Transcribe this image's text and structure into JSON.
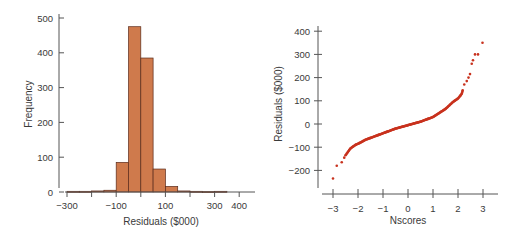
{
  "colors": {
    "bar_fill": "#cf7a4c",
    "bar_stroke": "#5a2a1a",
    "point": "#c8321e",
    "axis": "#555555",
    "text": "#3a3a3a"
  },
  "chart_data": [
    {
      "type": "bar",
      "subtype": "histogram",
      "title": "",
      "xlabel": "Residuals ($000)",
      "ylabel": "Frequency",
      "xlim": [
        -300,
        450
      ],
      "ylim": [
        0,
        500
      ],
      "x_ticks": [
        -300,
        -200,
        -100,
        0,
        100,
        200,
        300,
        400
      ],
      "x_tick_labels": [
        "-300",
        "",
        "-100",
        "",
        "100",
        "",
        "300",
        "400"
      ],
      "y_ticks": [
        0,
        100,
        200,
        300,
        400,
        500
      ],
      "y_tick_labels": [
        "0",
        "100",
        "200",
        "300",
        "400",
        "500"
      ],
      "grid": false,
      "bin_width": 50,
      "bins": [
        {
          "start": -300,
          "end": -250,
          "count": 2
        },
        {
          "start": -250,
          "end": -200,
          "count": 2
        },
        {
          "start": -200,
          "end": -150,
          "count": 3
        },
        {
          "start": -150,
          "end": -100,
          "count": 5
        },
        {
          "start": -100,
          "end": -50,
          "count": 85
        },
        {
          "start": -50,
          "end": 0,
          "count": 475
        },
        {
          "start": 0,
          "end": 50,
          "count": 385
        },
        {
          "start": 50,
          "end": 100,
          "count": 66
        },
        {
          "start": 100,
          "end": 150,
          "count": 16
        },
        {
          "start": 150,
          "end": 200,
          "count": 3
        },
        {
          "start": 200,
          "end": 250,
          "count": 2
        },
        {
          "start": 250,
          "end": 300,
          "count": 1
        },
        {
          "start": 300,
          "end": 350,
          "count": 2
        },
        {
          "start": 350,
          "end": 400,
          "count": 0
        }
      ]
    },
    {
      "type": "scatter",
      "subtype": "normal-probability-plot",
      "title": "",
      "xlabel": "Nscores",
      "ylabel": "Residuals ($000)",
      "xlim": [
        -3.4,
        3.5
      ],
      "ylim": [
        -270,
        420
      ],
      "x_ticks": [
        -3,
        -2,
        -1,
        0,
        1,
        2,
        3
      ],
      "x_tick_labels": [
        "-3",
        "-2",
        "-1",
        "0",
        "1",
        "2",
        "3"
      ],
      "y_ticks": [
        -200,
        -100,
        0,
        100,
        200,
        300,
        400
      ],
      "y_tick_labels": [
        "-200",
        "-100",
        "0",
        "100",
        "200",
        "300",
        "400"
      ],
      "grid": false,
      "outliers": [
        {
          "x": -3.0,
          "y": -235
        },
        {
          "x": -2.85,
          "y": -180
        },
        {
          "x": -2.65,
          "y": -165
        },
        {
          "x": -2.55,
          "y": -145
        },
        {
          "x": 2.25,
          "y": 170
        },
        {
          "x": 2.35,
          "y": 185
        },
        {
          "x": 2.42,
          "y": 200
        },
        {
          "x": 2.48,
          "y": 215
        },
        {
          "x": 2.55,
          "y": 260
        },
        {
          "x": 2.6,
          "y": 275
        },
        {
          "x": 2.68,
          "y": 300
        },
        {
          "x": 2.8,
          "y": 300
        },
        {
          "x": 2.98,
          "y": 350
        }
      ],
      "curve": [
        {
          "x": -2.5,
          "y": -135
        },
        {
          "x": -2.3,
          "y": -105
        },
        {
          "x": -2.1,
          "y": -90
        },
        {
          "x": -1.9,
          "y": -80
        },
        {
          "x": -1.7,
          "y": -68
        },
        {
          "x": -1.5,
          "y": -60
        },
        {
          "x": -1.0,
          "y": -40
        },
        {
          "x": -0.5,
          "y": -20
        },
        {
          "x": 0.0,
          "y": -5
        },
        {
          "x": 0.5,
          "y": 10
        },
        {
          "x": 1.0,
          "y": 30
        },
        {
          "x": 1.5,
          "y": 65
        },
        {
          "x": 1.8,
          "y": 95
        },
        {
          "x": 2.0,
          "y": 110
        },
        {
          "x": 2.15,
          "y": 130
        },
        {
          "x": 2.2,
          "y": 150
        }
      ]
    }
  ]
}
